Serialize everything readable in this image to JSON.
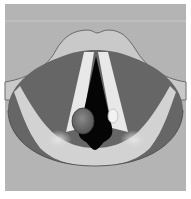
{
  "figure": {
    "title": "",
    "regions": [
      {
        "name": "background",
        "color": "#b4b4b4"
      },
      {
        "name": "epiglottis-arch",
        "color": "#c9c9c9"
      },
      {
        "name": "pharyngeal-wall",
        "color": "#666666"
      },
      {
        "name": "vocal-folds",
        "color": "#e8e8e8"
      },
      {
        "name": "glottis-opening",
        "color": "#050505"
      },
      {
        "name": "vocal-fold-lesion",
        "color": "#6e6e6e"
      },
      {
        "name": "arytenoid-region",
        "color": "#d2d2d2"
      },
      {
        "name": "small-cyst",
        "color": "#f2f2f2"
      }
    ]
  }
}
